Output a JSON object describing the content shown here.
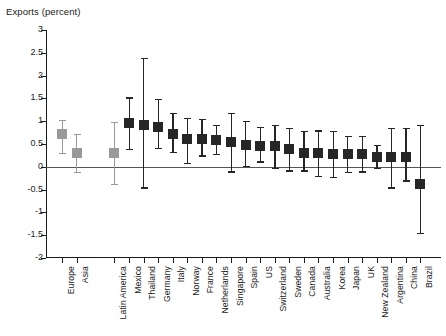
{
  "chart_data": {
    "type": "scatter",
    "title": "Exports (percent)",
    "subtitle": "",
    "xlabel": "",
    "ylabel": "Exports (percent)",
    "ylim": [
      -2,
      3
    ],
    "ytick_labels": [
      "3",
      "2.5",
      "2",
      "1.5",
      "1",
      "0.5",
      "0",
      "-0.5",
      "-1",
      "-1.5",
      "-2"
    ],
    "ytick_values": [
      3,
      2.5,
      2,
      1.5,
      1,
      0.5,
      0,
      -0.5,
      -1,
      -1.5,
      -2
    ],
    "grid": false,
    "legend_position": "none",
    "zero_reference_line": 0,
    "marker_style": "square-with-error-bars",
    "colors": {
      "region_marker": "#999999",
      "country_marker": "#262626",
      "axis": "#1a1a1a",
      "zero_line": "#555555",
      "background": "#ffffff"
    },
    "group_gap_after_index": 2,
    "categories": [
      "Europe",
      "Asia",
      "Latin America",
      "Mexico",
      "Thailand",
      "Germany",
      "Italy",
      "Norway",
      "France",
      "Netherlands",
      "Singapore",
      "Spain",
      "US",
      "Switzerland",
      "Sweden",
      "Canada",
      "Australia",
      "Korea",
      "Japan",
      "UK",
      "New Zealand",
      "Argentina",
      "China",
      "Brazil"
    ],
    "series": [
      {
        "name": "Estimate with 95% confidence interval",
        "points": [
          {
            "category": "Europe",
            "group": "region",
            "value": 0.72,
            "low": 0.3,
            "high": 1.02
          },
          {
            "category": "Asia",
            "group": "region",
            "value": 0.3,
            "low": -0.12,
            "high": 0.72
          },
          {
            "category": "Latin America",
            "group": "region",
            "value": 0.3,
            "low": -0.38,
            "high": 0.98
          },
          {
            "category": "Mexico",
            "group": "country",
            "value": 0.95,
            "low": 0.4,
            "high": 1.52
          },
          {
            "category": "Thailand",
            "group": "country",
            "value": 0.92,
            "low": -0.45,
            "high": 2.38
          },
          {
            "category": "Germany",
            "group": "country",
            "value": 0.88,
            "low": 0.42,
            "high": 1.48
          },
          {
            "category": "Italy",
            "group": "country",
            "value": 0.72,
            "low": 0.32,
            "high": 1.18
          },
          {
            "category": "Norway",
            "group": "country",
            "value": 0.62,
            "low": 0.08,
            "high": 1.08
          },
          {
            "category": "France",
            "group": "country",
            "value": 0.62,
            "low": 0.25,
            "high": 1.05
          },
          {
            "category": "Netherlands",
            "group": "country",
            "value": 0.58,
            "low": 0.28,
            "high": 0.92
          },
          {
            "category": "Singapore",
            "group": "country",
            "value": 0.55,
            "low": -0.1,
            "high": 1.18
          },
          {
            "category": "Spain",
            "group": "country",
            "value": 0.48,
            "low": 0.02,
            "high": 1.0
          },
          {
            "category": "US",
            "group": "country",
            "value": 0.46,
            "low": 0.12,
            "high": 0.88
          },
          {
            "category": "Switzerland",
            "group": "country",
            "value": 0.45,
            "low": -0.02,
            "high": 0.92
          },
          {
            "category": "Sweden",
            "group": "country",
            "value": 0.38,
            "low": -0.08,
            "high": 0.85
          },
          {
            "category": "Canada",
            "group": "country",
            "value": 0.3,
            "low": -0.08,
            "high": 0.78
          },
          {
            "category": "Australia",
            "group": "country",
            "value": 0.3,
            "low": -0.2,
            "high": 0.8
          },
          {
            "category": "Korea",
            "group": "country",
            "value": 0.28,
            "low": -0.22,
            "high": 0.78
          },
          {
            "category": "Japan",
            "group": "country",
            "value": 0.28,
            "low": -0.12,
            "high": 0.68
          },
          {
            "category": "UK",
            "group": "country",
            "value": 0.28,
            "low": -0.1,
            "high": 0.68
          },
          {
            "category": "New Zealand",
            "group": "country",
            "value": 0.22,
            "low": -0.02,
            "high": 0.48
          },
          {
            "category": "Argentina",
            "group": "country",
            "value": 0.22,
            "low": -0.45,
            "high": 0.85
          },
          {
            "category": "China",
            "group": "country",
            "value": 0.22,
            "low": -0.3,
            "high": 0.85
          },
          {
            "category": "Brazil",
            "group": "country",
            "value": -0.38,
            "low": -1.45,
            "high": 0.92
          }
        ]
      }
    ]
  }
}
